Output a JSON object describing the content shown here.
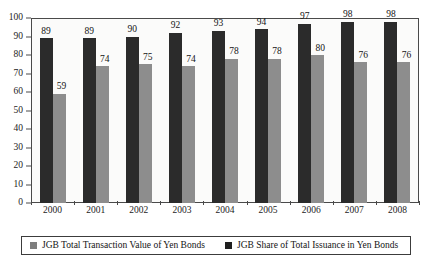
{
  "chart_data": {
    "type": "bar",
    "title": "",
    "xlabel": "",
    "ylabel": "",
    "ylim": [
      0,
      100
    ],
    "yticks": [
      0,
      10,
      20,
      30,
      40,
      50,
      60,
      70,
      80,
      90,
      100
    ],
    "grid": false,
    "legend_position": "bottom",
    "categories": [
      "2000",
      "2001",
      "2002",
      "2003",
      "2004",
      "2005",
      "2006",
      "2007",
      "2008"
    ],
    "series": [
      {
        "name": "JGB Total Transaction Value of Yen Bonds",
        "color": "#2b2b2b",
        "legend_swatch_color": "#7e7e7e",
        "values": [
          89,
          89,
          90,
          92,
          93,
          94,
          97,
          98,
          98
        ]
      },
      {
        "name": "JGB Share of Total Issuance in Yen Bonds",
        "color": "#8d8d8d",
        "legend_swatch_color": "#1f1f1f",
        "values": [
          59,
          74,
          75,
          74,
          78,
          78,
          80,
          76,
          76
        ]
      }
    ]
  },
  "legend": {
    "items": [
      {
        "label": "JGB Total Transaction Value of Yen Bonds"
      },
      {
        "label": "JGB Share of Total Issuance in Yen Bonds"
      }
    ]
  }
}
